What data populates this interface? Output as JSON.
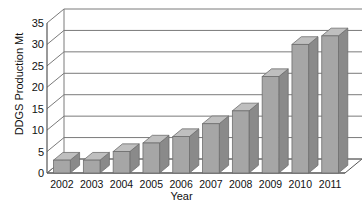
{
  "chart_data": {
    "type": "bar",
    "title": "",
    "subtitle": "",
    "xlabel": "Year",
    "ylabel": "DDGS Production Mt",
    "categories": [
      "2002",
      "2003",
      "2004",
      "2005",
      "2006",
      "2007",
      "2008",
      "2009",
      "2010",
      "2011"
    ],
    "values": [
      3,
      3,
      5,
      7,
      8.5,
      11.5,
      14.5,
      22.5,
      30,
      32
    ],
    "series": [
      {
        "name": "DDGS Production",
        "values": [
          3,
          3,
          5,
          7,
          8.5,
          11.5,
          14.5,
          22.5,
          30,
          32
        ]
      }
    ],
    "ylim": [
      0,
      35
    ],
    "yticks": [
      0,
      5,
      10,
      15,
      20,
      25,
      30,
      35
    ],
    "ytick_labels": [
      "0",
      "5",
      "10",
      "15",
      "20",
      "25",
      "30",
      "35"
    ],
    "grid": true,
    "grid_axis": "y",
    "legend": false,
    "legend_position": "none",
    "style": "3d-column",
    "colors": {
      "bar_front": "#a6a6a6",
      "bar_side": "#8a8a8a",
      "bar_top": "#bfbfbf",
      "bar_edge": "#6e6e6e",
      "grid": "#7a7a7a",
      "axis": "#555555",
      "text": "#111111",
      "background": "#ffffff",
      "floor": "#ffffff"
    }
  }
}
